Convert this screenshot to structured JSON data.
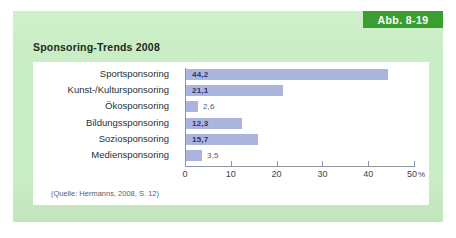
{
  "figure": {
    "badge_label": "Abb. 8-19",
    "title": "Sponsoring-Trends 2008",
    "source_note": "(Quelle: Hermanns, 2008, S. 12)",
    "badge_color": "#3a9e32",
    "card_color": "#c9edc4",
    "panel_color": "#ffffff",
    "bar_color": "#aab4dd"
  },
  "chart_data": {
    "type": "bar",
    "orientation": "horizontal",
    "title": "Sponsoring-Trends 2008",
    "xlabel": "%",
    "ylabel": "",
    "categories": [
      "Sportsponsoring",
      "Kunst-/Kultursponsoring",
      "Ökosponsoring",
      "Bildungssponsoring",
      "Soziosponsoring",
      "Mediensponsoring"
    ],
    "values": [
      44.2,
      21.1,
      2.6,
      12.3,
      15.7,
      3.5
    ],
    "value_labels": [
      "44,2",
      "21,1",
      "2,6",
      "12,3",
      "15,7",
      "3,5"
    ],
    "xlim": [
      0,
      50
    ],
    "xticks": [
      0,
      10,
      20,
      30,
      40,
      50
    ],
    "xtick_labels": [
      "0",
      "10",
      "20",
      "30",
      "40",
      "50"
    ],
    "xtick_unit": "%",
    "grid": false,
    "legend": false,
    "series_color": "#aab4dd",
    "source": "(Quelle: Hermanns, 2008, S. 12)"
  }
}
